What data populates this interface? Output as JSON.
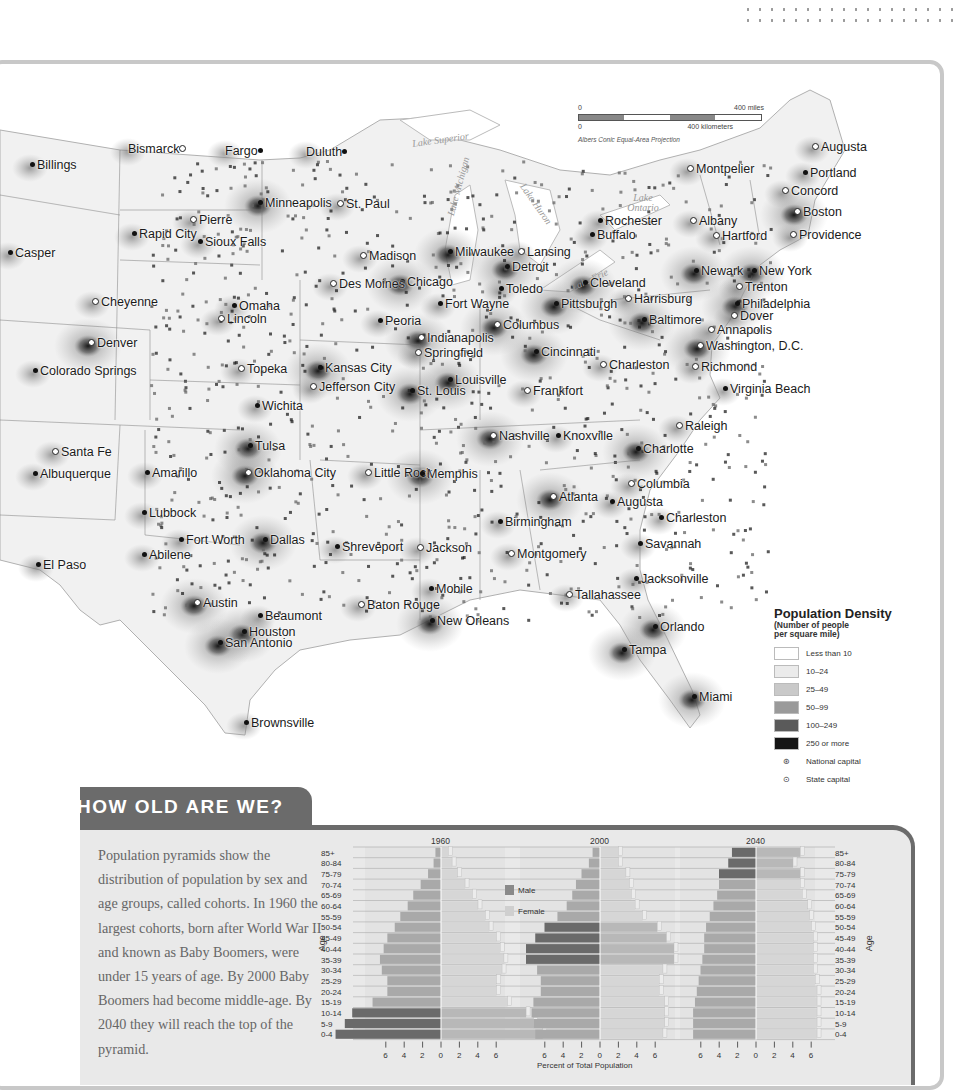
{
  "map": {
    "scale": {
      "miles_start": "0",
      "miles_end": "400 miles",
      "km_start": "0",
      "km_end": "400 kilometers",
      "projection": "Albers Conic Equal-Area Projection"
    },
    "lakes": [
      "Lake Superior",
      "Lake Michigan",
      "Lake Huron",
      "Lake Ontario",
      "Lake Erie"
    ],
    "cities": [
      {
        "name": "Billings",
        "x": 30,
        "y": 166,
        "type": "city"
      },
      {
        "name": "Bismarck",
        "x": 128,
        "y": 150,
        "type": "state-capital",
        "after": true
      },
      {
        "name": "Fargo",
        "x": 225,
        "y": 152,
        "type": "city",
        "after": true
      },
      {
        "name": "Duluth",
        "x": 306,
        "y": 153,
        "type": "city",
        "after": true
      },
      {
        "name": "Minneapolis",
        "x": 258,
        "y": 204,
        "type": "city"
      },
      {
        "name": "St. Paul",
        "x": 337,
        "y": 205,
        "type": "state-capital"
      },
      {
        "name": "Pierre",
        "x": 190,
        "y": 221,
        "type": "state-capital"
      },
      {
        "name": "Rapid City",
        "x": 132,
        "y": 235,
        "type": "city"
      },
      {
        "name": "Sioux Falls",
        "x": 198,
        "y": 243,
        "type": "city"
      },
      {
        "name": "Casper",
        "x": 8,
        "y": 254,
        "type": "city"
      },
      {
        "name": "Madison",
        "x": 360,
        "y": 257,
        "type": "state-capital"
      },
      {
        "name": "Milwaukee",
        "x": 448,
        "y": 253,
        "type": "city"
      },
      {
        "name": "Lansing",
        "x": 518,
        "y": 253,
        "type": "state-capital"
      },
      {
        "name": "Detroit",
        "x": 505,
        "y": 268,
        "type": "city"
      },
      {
        "name": "Chicago",
        "x": 400,
        "y": 283,
        "type": "city"
      },
      {
        "name": "Toledo",
        "x": 499,
        "y": 290,
        "type": "city"
      },
      {
        "name": "Cheyenne",
        "x": 92,
        "y": 303,
        "type": "state-capital"
      },
      {
        "name": "Des Moines",
        "x": 330,
        "y": 285,
        "type": "state-capital"
      },
      {
        "name": "Omaha",
        "x": 232,
        "y": 307,
        "type": "city"
      },
      {
        "name": "Lincoln",
        "x": 218,
        "y": 320,
        "type": "state-capital"
      },
      {
        "name": "Fort Wayne",
        "x": 438,
        "y": 305,
        "type": "city"
      },
      {
        "name": "Peoria",
        "x": 378,
        "y": 322,
        "type": "city"
      },
      {
        "name": "Columbus",
        "x": 494,
        "y": 326,
        "type": "state-capital"
      },
      {
        "name": "Indianapolis",
        "x": 418,
        "y": 339,
        "type": "state-capital"
      },
      {
        "name": "Springfield",
        "x": 415,
        "y": 354,
        "type": "state-capital"
      },
      {
        "name": "Cincinnati",
        "x": 534,
        "y": 353,
        "type": "city"
      },
      {
        "name": "Denver",
        "x": 88,
        "y": 344,
        "type": "state-capital"
      },
      {
        "name": "Colorado Springs",
        "x": 33,
        "y": 372,
        "type": "city"
      },
      {
        "name": "Topeka",
        "x": 238,
        "y": 370,
        "type": "state-capital"
      },
      {
        "name": "Kansas City",
        "x": 318,
        "y": 369,
        "type": "city"
      },
      {
        "name": "Jefferson City",
        "x": 310,
        "y": 388,
        "type": "state-capital"
      },
      {
        "name": "Louisville",
        "x": 448,
        "y": 381,
        "type": "city"
      },
      {
        "name": "St. Louis",
        "x": 410,
        "y": 392,
        "type": "city"
      },
      {
        "name": "Frankfort",
        "x": 524,
        "y": 392,
        "type": "state-capital"
      },
      {
        "name": "Charleston",
        "x": 600,
        "y": 366,
        "type": "state-capital"
      },
      {
        "name": "Wichita",
        "x": 255,
        "y": 407,
        "type": "city"
      },
      {
        "name": "Rochester",
        "x": 598,
        "y": 222,
        "type": "city"
      },
      {
        "name": "Buffalo",
        "x": 590,
        "y": 236,
        "type": "city"
      },
      {
        "name": "Montpelier",
        "x": 687,
        "y": 170,
        "type": "state-capital"
      },
      {
        "name": "Augusta",
        "x": 812,
        "y": 148,
        "type": "state-capital"
      },
      {
        "name": "Portland",
        "x": 803,
        "y": 174,
        "type": "city"
      },
      {
        "name": "Concord",
        "x": 782,
        "y": 192,
        "type": "state-capital"
      },
      {
        "name": "Albany",
        "x": 690,
        "y": 222,
        "type": "state-capital"
      },
      {
        "name": "Boston",
        "x": 794,
        "y": 213,
        "type": "state-capital"
      },
      {
        "name": "Hartford",
        "x": 713,
        "y": 237,
        "type": "state-capital"
      },
      {
        "name": "Providence",
        "x": 790,
        "y": 236,
        "type": "state-capital"
      },
      {
        "name": "Cleveland",
        "x": 583,
        "y": 284,
        "type": "city"
      },
      {
        "name": "Pittsburgh",
        "x": 554,
        "y": 305,
        "type": "city"
      },
      {
        "name": "Newark",
        "x": 694,
        "y": 272,
        "type": "city"
      },
      {
        "name": "New York",
        "x": 752,
        "y": 272,
        "type": "city"
      },
      {
        "name": "Trenton",
        "x": 736,
        "y": 288,
        "type": "state-capital"
      },
      {
        "name": "Harrisburg",
        "x": 625,
        "y": 300,
        "type": "state-capital"
      },
      {
        "name": "Philadelphia",
        "x": 735,
        "y": 305,
        "type": "city"
      },
      {
        "name": "Baltimore",
        "x": 642,
        "y": 321,
        "type": "city"
      },
      {
        "name": "Dover",
        "x": 731,
        "y": 317,
        "type": "state-capital"
      },
      {
        "name": "Annapolis",
        "x": 708,
        "y": 331,
        "type": "state-capital"
      },
      {
        "name": "Washington, D.C.",
        "x": 697,
        "y": 347,
        "type": "national-capital"
      },
      {
        "name": "Richmond",
        "x": 692,
        "y": 368,
        "type": "state-capital"
      },
      {
        "name": "Virginia Beach",
        "x": 723,
        "y": 390,
        "type": "city"
      },
      {
        "name": "Nashville",
        "x": 490,
        "y": 437,
        "type": "state-capital"
      },
      {
        "name": "Knoxville",
        "x": 556,
        "y": 437,
        "type": "city"
      },
      {
        "name": "Raleigh",
        "x": 676,
        "y": 427,
        "type": "state-capital"
      },
      {
        "name": "Charlotte",
        "x": 636,
        "y": 450,
        "type": "city"
      },
      {
        "name": "Santa Fe",
        "x": 52,
        "y": 453,
        "type": "state-capital"
      },
      {
        "name": "Albuquerque",
        "x": 33,
        "y": 475,
        "type": "city"
      },
      {
        "name": "Amarillo",
        "x": 145,
        "y": 474,
        "type": "city"
      },
      {
        "name": "Tulsa",
        "x": 248,
        "y": 447,
        "type": "city"
      },
      {
        "name": "Oklahoma City",
        "x": 245,
        "y": 474,
        "type": "state-capital"
      },
      {
        "name": "Little Rock",
        "x": 365,
        "y": 474,
        "type": "state-capital"
      },
      {
        "name": "Memphis",
        "x": 420,
        "y": 475,
        "type": "city"
      },
      {
        "name": "Atlanta",
        "x": 550,
        "y": 498,
        "type": "state-capital"
      },
      {
        "name": "Augusta",
        "x": 610,
        "y": 503,
        "type": "city"
      },
      {
        "name": "Columbia",
        "x": 628,
        "y": 485,
        "type": "state-capital"
      },
      {
        "name": "Lubbock",
        "x": 142,
        "y": 514,
        "type": "city"
      },
      {
        "name": "Birmingham",
        "x": 498,
        "y": 523,
        "type": "city"
      },
      {
        "name": "Charleston",
        "x": 659,
        "y": 519,
        "type": "city"
      },
      {
        "name": "Fort Worth",
        "x": 179,
        "y": 541,
        "type": "city"
      },
      {
        "name": "Dallas",
        "x": 263,
        "y": 541,
        "type": "city"
      },
      {
        "name": "Shreveport",
        "x": 335,
        "y": 548,
        "type": "city"
      },
      {
        "name": "Jackson",
        "x": 417,
        "y": 549,
        "type": "state-capital"
      },
      {
        "name": "Savannah",
        "x": 638,
        "y": 545,
        "type": "city"
      },
      {
        "name": "Abilene",
        "x": 142,
        "y": 556,
        "type": "city"
      },
      {
        "name": "Montgomery",
        "x": 508,
        "y": 555,
        "type": "state-capital"
      },
      {
        "name": "El Paso",
        "x": 36,
        "y": 566,
        "type": "city"
      },
      {
        "name": "Jacksonville",
        "x": 634,
        "y": 580,
        "type": "city"
      },
      {
        "name": "Mobile",
        "x": 429,
        "y": 590,
        "type": "city"
      },
      {
        "name": "Tallahassee",
        "x": 566,
        "y": 596,
        "type": "state-capital"
      },
      {
        "name": "Austin",
        "x": 194,
        "y": 604,
        "type": "state-capital"
      },
      {
        "name": "Beaumont",
        "x": 258,
        "y": 617,
        "type": "city"
      },
      {
        "name": "Baton Rouge",
        "x": 358,
        "y": 606,
        "type": "state-capital"
      },
      {
        "name": "New Orleans",
        "x": 430,
        "y": 622,
        "type": "city"
      },
      {
        "name": "Houston",
        "x": 242,
        "y": 633,
        "type": "city"
      },
      {
        "name": "San Antonio",
        "x": 218,
        "y": 644,
        "type": "city"
      },
      {
        "name": "Orlando",
        "x": 653,
        "y": 628,
        "type": "city"
      },
      {
        "name": "Tampa",
        "x": 622,
        "y": 651,
        "type": "city"
      },
      {
        "name": "Miami",
        "x": 692,
        "y": 698,
        "type": "city"
      },
      {
        "name": "Brownsville",
        "x": 244,
        "y": 724,
        "type": "city"
      }
    ]
  },
  "legend": {
    "title": "Population Density",
    "subtitle_line1": "(Number of people",
    "subtitle_line2": "per square mile)",
    "items": [
      {
        "label": "Less than 10",
        "color": "#ffffff"
      },
      {
        "label": "10–24",
        "color": "#ebebeb"
      },
      {
        "label": "25–49",
        "color": "#c9c9c9"
      },
      {
        "label": "50–99",
        "color": "#9a9a9a"
      },
      {
        "label": "100–249",
        "color": "#5a5a5a"
      },
      {
        "label": "250 or more",
        "color": "#151515"
      }
    ],
    "symbols": [
      {
        "label": "National capital",
        "glyph": "⊛"
      },
      {
        "label": "State capital",
        "glyph": "⊙"
      }
    ]
  },
  "how_old": {
    "heading": "HOW OLD ARE WE?",
    "paragraph": "Population pyramids show the distribution of population by sex and age groups, called cohorts. In 1960 the largest cohorts, born after World War II and known as Baby Boomers, were under 15 years of age. By 2000 Baby Boomers had become middle-age. By 2040 they will reach the top of the pyramid."
  },
  "chart_data": {
    "type": "bar",
    "subtype": "population-pyramid",
    "xlabel": "Percent of Total Population",
    "ylabel": "Age",
    "xlim": [
      -6,
      6
    ],
    "x_ticks": [
      "6",
      "4",
      "2",
      "0",
      "2",
      "4",
      "6"
    ],
    "legend": [
      {
        "name": "Male",
        "color": "#8a8a8a"
      },
      {
        "name": "Female",
        "color": "#cfcfcf"
      }
    ],
    "baby_boomer_highlight_color": "#6a6a6a",
    "categories": [
      "85+",
      "80-84",
      "75-79",
      "70-74",
      "65-69",
      "60-64",
      "55-59",
      "50-54",
      "45-49",
      "40-44",
      "35-39",
      "30-34",
      "25-29",
      "20-24",
      "15-19",
      "10-14",
      "5-9",
      "0-4"
    ],
    "panels": [
      {
        "year": "1960",
        "male": [
          0.3,
          0.4,
          0.7,
          1.1,
          1.5,
          1.8,
          2.2,
          2.5,
          2.9,
          3.1,
          3.3,
          3.2,
          2.9,
          2.9,
          3.7,
          4.8,
          5.2,
          5.7
        ],
        "female": [
          0.4,
          0.6,
          0.9,
          1.3,
          1.7,
          2.0,
          2.4,
          2.6,
          3.0,
          3.2,
          3.4,
          3.3,
          3.0,
          3.0,
          3.6,
          4.6,
          5.0,
          5.5
        ],
        "boomer_rows": [
          "10-14",
          "5-9",
          "0-4"
        ]
      },
      {
        "year": "2000",
        "male": [
          0.4,
          0.6,
          1.0,
          1.3,
          1.5,
          1.8,
          2.3,
          3.0,
          3.5,
          4.0,
          4.0,
          3.4,
          3.2,
          3.2,
          3.6,
          3.7,
          3.6,
          3.5
        ],
        "female": [
          1.0,
          1.0,
          1.4,
          1.6,
          1.7,
          1.9,
          2.3,
          3.1,
          3.6,
          4.0,
          4.0,
          3.4,
          3.2,
          3.2,
          3.5,
          3.5,
          3.5,
          3.4
        ],
        "boomer_rows": [
          "50-54",
          "45-49",
          "40-44",
          "35-39"
        ]
      },
      {
        "year": "2040",
        "male": [
          1.3,
          1.5,
          2.0,
          2.0,
          2.1,
          2.3,
          2.5,
          2.7,
          2.8,
          2.8,
          2.9,
          3.0,
          3.1,
          3.2,
          3.3,
          3.4,
          3.4,
          3.4
        ],
        "female": [
          2.4,
          2.0,
          2.4,
          2.4,
          2.5,
          2.8,
          2.9,
          3.0,
          3.1,
          3.1,
          3.1,
          3.1,
          3.2,
          3.3,
          3.3,
          3.3,
          3.3,
          3.3
        ],
        "boomer_rows": [
          "85+",
          "80-84",
          "75-79"
        ]
      }
    ]
  }
}
